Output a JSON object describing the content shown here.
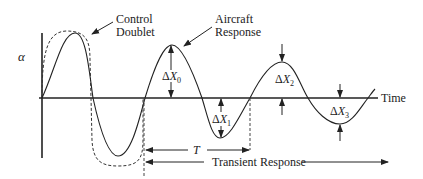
{
  "diagram": {
    "type": "aircraft-dynamic-response",
    "y_axis_label": "α",
    "x_axis_label": "Time",
    "annotations": {
      "control_doublet": [
        "Control",
        "Doublet"
      ],
      "aircraft_response": [
        "Aircraft",
        "Response"
      ],
      "period": "T",
      "transient_response": "Transient Response"
    },
    "amplitudes": [
      {
        "delta": "Δ",
        "symbol": "X",
        "sub": "0"
      },
      {
        "delta": "Δ",
        "symbol": "X",
        "sub": "1"
      },
      {
        "delta": "Δ",
        "symbol": "X",
        "sub": "2"
      },
      {
        "delta": "Δ",
        "symbol": "X",
        "sub": "3"
      }
    ],
    "colors": {
      "line": "#222222",
      "background": "#ffffff"
    }
  }
}
